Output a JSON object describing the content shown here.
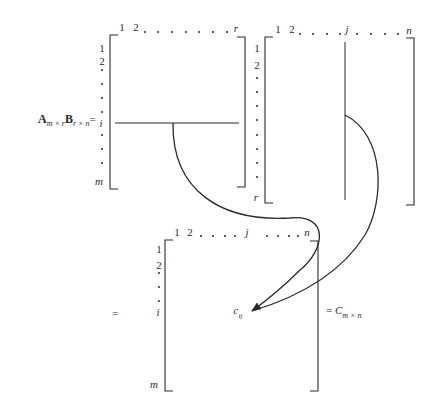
{
  "equation": {
    "lhs": {
      "A_symbol": "A",
      "A_subscript": "m × r",
      "B_symbol": "B",
      "B_subscript": "r × n",
      "equals": "="
    },
    "middle_equals": "=",
    "rhs": {
      "equals": "= ",
      "C_symbol": "C",
      "C_subscript": "m × n"
    }
  },
  "matrix_A": {
    "col_labels": {
      "first": "1",
      "second": "2",
      "last": "r"
    },
    "row_labels": {
      "first": "1",
      "second": "2",
      "highlight": "i",
      "last": "m"
    },
    "highlighted_row": "i"
  },
  "matrix_B": {
    "col_labels": {
      "first": "1",
      "second": "2",
      "highlight": "j",
      "last": "n"
    },
    "row_labels": {
      "first": "1",
      "second": "2",
      "last": "r"
    },
    "highlighted_column": "j"
  },
  "matrix_C": {
    "col_labels": {
      "first": "1",
      "second": "2",
      "highlight": "j",
      "last": "n"
    },
    "row_labels": {
      "first": "1",
      "second": "2",
      "highlight": "i",
      "last": "m"
    },
    "element": {
      "symbol": "c",
      "subscript": "ij"
    }
  },
  "colors": {
    "ink": "#2a2a2a",
    "background": "#ffffff"
  }
}
